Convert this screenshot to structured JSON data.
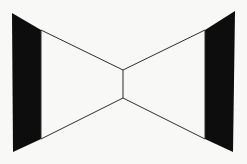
{
  "figure": {
    "canvas": {
      "width": 247,
      "height": 164
    },
    "colors": {
      "background": "#f8f8f6",
      "fill_black": "#0d0d0d",
      "stroke_line": "#2e2e2e"
    },
    "stroke_width": 1,
    "shapes": [
      {
        "name": "left-black-trapezoid",
        "kind": "polygon",
        "fill": "#0d0d0d",
        "stroke": "none",
        "points": "12,13 41,30 41,139 13,152"
      },
      {
        "name": "right-black-trapezoid",
        "kind": "polygon",
        "fill": "#0d0d0d",
        "stroke": "none",
        "points": "235,11 205,30 205,139 233,152"
      },
      {
        "name": "upper-bowtie-wing",
        "kind": "polyline",
        "fill": "none",
        "stroke": "#2e2e2e",
        "points": "41,30 123,70 205,30"
      },
      {
        "name": "lower-bowtie-wing",
        "kind": "polyline",
        "fill": "none",
        "stroke": "#2e2e2e",
        "points": "41,139 123,98 205,139"
      },
      {
        "name": "center-waist-line",
        "kind": "line",
        "fill": "none",
        "stroke": "#2e2e2e",
        "points": "123,70 123,98"
      },
      {
        "name": "left-inner-vertical-edge",
        "kind": "line",
        "fill": "none",
        "stroke": "#2e2e2e",
        "points": "41,30 41,139"
      },
      {
        "name": "right-inner-vertical-edge",
        "kind": "line",
        "fill": "none",
        "stroke": "#2e2e2e",
        "points": "205,30 205,139"
      }
    ]
  }
}
